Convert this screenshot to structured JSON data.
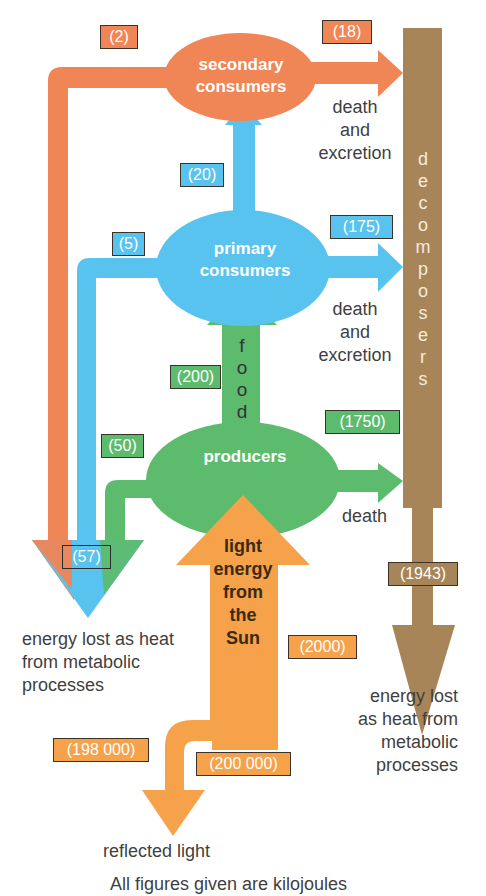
{
  "colors": {
    "secondary": "#f08556",
    "primary": "#58c3ef",
    "producers": "#5dbb6e",
    "sunlight": "#f6a24a",
    "decomposers": "#a88558",
    "text": "#3f3f3f"
  },
  "nodes": {
    "secondary_consumers": {
      "line1": "secondary",
      "line2": "consumers"
    },
    "primary_consumers": {
      "line1": "primary",
      "line2": "consumers"
    },
    "producers": {
      "label": "producers"
    },
    "decomposers": {
      "letters": [
        "d",
        "e",
        "c",
        "o",
        "m",
        "p",
        "o",
        "s",
        "e",
        "r",
        "s"
      ]
    },
    "sun": {
      "lines": [
        "light",
        "energy",
        "from",
        "the",
        "Sun"
      ]
    }
  },
  "flows": {
    "secondary_heat": "(2)",
    "secondary_to_decomposers": "(18)",
    "primary_to_secondary": "(20)",
    "primary_heat": "(5)",
    "primary_to_decomposers": "(175)",
    "producers_to_primary": "(200)",
    "producers_heat": "(50)",
    "producers_to_decomposers": "(1750)",
    "total_heat_left": "(57)",
    "decomposers_heat": "(1943)",
    "sun_absorbed": "(2000)",
    "sun_reflected": "(198 000)",
    "sun_total": "(200 000)"
  },
  "labels": {
    "food_letters": [
      "f",
      "o",
      "o",
      "d"
    ],
    "death_excretion_1": [
      "death",
      "and",
      "excretion"
    ],
    "death_excretion_2": [
      "death",
      "and",
      "excretion"
    ],
    "death": "death",
    "heat_left": [
      "energy lost as heat",
      "from metabolic",
      "processes"
    ],
    "heat_right": [
      "energy lost",
      "as heat from",
      "metabolic",
      "processes"
    ],
    "reflected": "reflected light",
    "footer": "All figures given are kilojoules"
  }
}
